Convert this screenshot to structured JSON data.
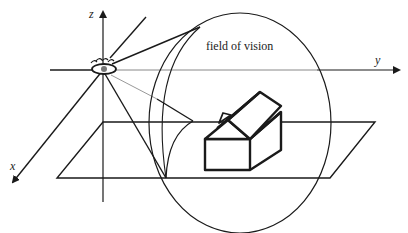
{
  "diagram": {
    "title_label": "field of vision",
    "axes": {
      "x": "x",
      "y": "y",
      "z": "z"
    },
    "elements": [
      "eye",
      "view-cone",
      "field-of-vision-circle",
      "ground-plane",
      "house"
    ],
    "colors": {
      "stroke": "#1a1a1a",
      "light_stroke": "#888888",
      "background": "#ffffff"
    }
  }
}
